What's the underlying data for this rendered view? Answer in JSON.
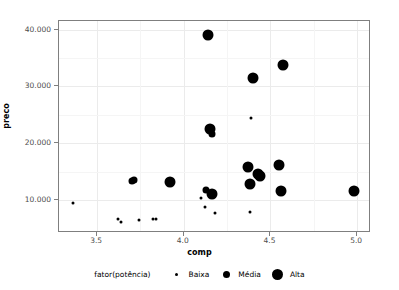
{
  "chart_data": {
    "type": "scatter",
    "title": "",
    "xlabel": "comp",
    "ylabel": "preco",
    "xlim": [
      3.28,
      5.08
    ],
    "ylim": [
      4200,
      41500
    ],
    "xticks": [
      "3.5",
      "4.0",
      "4.5",
      "5.0"
    ],
    "xtick_values": [
      3.5,
      4.0,
      4.5,
      5.0
    ],
    "yticks": [
      "10.000",
      "20.000",
      "30.000",
      "40.000"
    ],
    "ytick_values": [
      10000,
      20000,
      30000,
      40000
    ],
    "grid": true,
    "legend_position": "bottom",
    "size_legend_title": "fator(potência)",
    "size_levels": [
      {
        "label": "Baixa",
        "glyph_px": 3
      },
      {
        "label": "Média",
        "glyph_px": 7
      },
      {
        "label": "Alta",
        "glyph_px": 11
      }
    ],
    "point_color": "#000000",
    "points": [
      {
        "x": 3.36,
        "y": 9500,
        "size": "Baixa"
      },
      {
        "x": 3.62,
        "y": 6600,
        "size": "Baixa"
      },
      {
        "x": 3.64,
        "y": 6100,
        "size": "Baixa"
      },
      {
        "x": 3.74,
        "y": 6500,
        "size": "Baixa"
      },
      {
        "x": 3.82,
        "y": 6600,
        "size": "Baixa"
      },
      {
        "x": 3.84,
        "y": 6600,
        "size": "Baixa"
      },
      {
        "x": 3.7,
        "y": 13300,
        "size": "Média"
      },
      {
        "x": 3.71,
        "y": 13500,
        "size": "Média"
      },
      {
        "x": 3.92,
        "y": 13100,
        "size": "Alta"
      },
      {
        "x": 4.14,
        "y": 39000,
        "size": "Alta"
      },
      {
        "x": 4.15,
        "y": 22500,
        "size": "Alta"
      },
      {
        "x": 4.16,
        "y": 21700,
        "size": "Média"
      },
      {
        "x": 4.13,
        "y": 11700,
        "size": "Média"
      },
      {
        "x": 4.16,
        "y": 11000,
        "size": "Alta"
      },
      {
        "x": 4.1,
        "y": 10400,
        "size": "Baixa"
      },
      {
        "x": 4.12,
        "y": 8800,
        "size": "Baixa"
      },
      {
        "x": 4.18,
        "y": 7800,
        "size": "Baixa"
      },
      {
        "x": 4.4,
        "y": 31500,
        "size": "Alta"
      },
      {
        "x": 4.39,
        "y": 24500,
        "size": "Baixa"
      },
      {
        "x": 4.37,
        "y": 15800,
        "size": "Alta"
      },
      {
        "x": 4.43,
        "y": 14600,
        "size": "Alta"
      },
      {
        "x": 4.44,
        "y": 14200,
        "size": "Alta"
      },
      {
        "x": 4.38,
        "y": 12800,
        "size": "Alta"
      },
      {
        "x": 4.38,
        "y": 7900,
        "size": "Baixa"
      },
      {
        "x": 4.57,
        "y": 33700,
        "size": "Alta"
      },
      {
        "x": 4.55,
        "y": 16200,
        "size": "Alta"
      },
      {
        "x": 4.56,
        "y": 11600,
        "size": "Alta"
      },
      {
        "x": 4.98,
        "y": 11600,
        "size": "Alta"
      }
    ]
  }
}
